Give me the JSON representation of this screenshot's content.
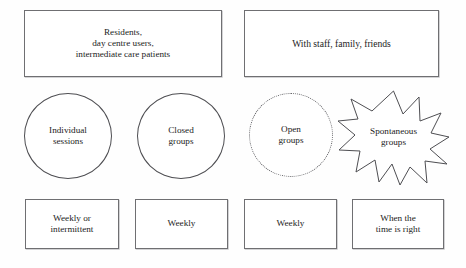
{
  "diagram": {
    "type": "matrix-diagram",
    "background_color": "#fefefe",
    "line_color": "#6f6f72",
    "text_color": "#1c1c1c",
    "top_row": [
      {
        "id": "participants-residents",
        "shape": "rectangle",
        "border_style": "solid",
        "label": "Residents,\nday centre users,\nintermediate care patients"
      },
      {
        "id": "participants-staff",
        "shape": "rectangle",
        "border_style": "solid",
        "label": "With staff, family, friends"
      }
    ],
    "middle_row": [
      {
        "id": "individual-sessions",
        "shape": "circle",
        "border_style": "solid",
        "label": "Individual\nsessions"
      },
      {
        "id": "closed-groups",
        "shape": "circle",
        "border_style": "solid",
        "label": "Closed\ngroups"
      },
      {
        "id": "open-groups",
        "shape": "circle",
        "border_style": "dotted",
        "label": "Open\ngroups"
      },
      {
        "id": "spontaneous-groups",
        "shape": "starburst",
        "border_style": "solid",
        "points": 12,
        "label": "Spontaneous\ngroups"
      }
    ],
    "bottom_row": [
      {
        "id": "frequency-weekly-or-intermittent",
        "shape": "rectangle",
        "border_style": "solid",
        "label": "Weekly or\nintermittent"
      },
      {
        "id": "frequency-weekly-closed",
        "shape": "rectangle",
        "border_style": "solid",
        "label": "Weekly"
      },
      {
        "id": "frequency-weekly-open",
        "shape": "rectangle",
        "border_style": "solid",
        "label": "Weekly"
      },
      {
        "id": "frequency-when-time-is-right",
        "shape": "rectangle",
        "border_style": "solid",
        "label": "When the\ntime is right"
      }
    ]
  }
}
